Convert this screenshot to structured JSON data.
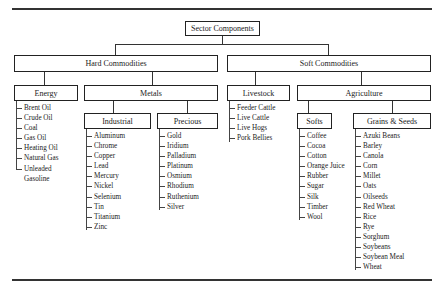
{
  "title": "Sector Components",
  "sectors": {
    "hard": {
      "label": "Hard Commodities",
      "energy": {
        "label": "Energy",
        "items": [
          "Brent Oil",
          "Crude Oil",
          "Coal",
          "Gas Oil",
          "Heating Oil",
          "Natural Gas",
          "Unleaded",
          "Gasoline"
        ]
      },
      "metals": {
        "label": "Metals",
        "industrial": {
          "label": "Industrial",
          "items": [
            "Aluminum",
            "Chrome",
            "Copper",
            "Lead",
            "Mercury",
            "Nickel",
            "Selenium",
            "Tin",
            "Titanium",
            "Zinc"
          ]
        },
        "precious": {
          "label": "Precious",
          "items": [
            "Gold",
            "Iridium",
            "Palladium",
            "Platinum",
            "Osmium",
            "Rhodium",
            "Ruthenium",
            "Silver"
          ]
        }
      }
    },
    "soft": {
      "label": "Soft Commodities",
      "livestock": {
        "label": "Livestock",
        "items": [
          "Feeder Cattle",
          "Live Cattle",
          "Live Hogs",
          "Pork Bellies"
        ]
      },
      "agriculture": {
        "label": "Agriculture",
        "softs": {
          "label": "Softs",
          "items": [
            "Coffee",
            "Cocoa",
            "Cotton",
            "Orange Juice",
            "Rubber",
            "Sugar",
            "Silk",
            "Timber",
            "Wool"
          ]
        },
        "grains": {
          "label": "Grains & Seeds",
          "items": [
            "Azuki Beans",
            "Barley",
            "Canola",
            "Corn",
            "Millet",
            "Oats",
            "Oilseeds",
            "Red Wheat",
            "Rice",
            "Rye",
            "Sorghum",
            "Soybeans",
            "Soybean Meal",
            "Wheat"
          ]
        }
      }
    }
  }
}
